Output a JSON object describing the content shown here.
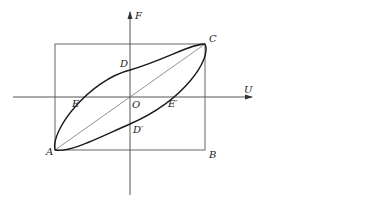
{
  "figure": {
    "axes": {
      "x_label": "U",
      "y_label": "F",
      "origin_label": "O"
    },
    "points": {
      "A": "A",
      "B": "B",
      "C": "C",
      "D": "D",
      "D_prime": "D′",
      "E": "E",
      "E_prime": "E′"
    },
    "colors": {
      "loop": "#1a1a1a",
      "axis": "#555555",
      "rect": "#666666",
      "diagonal": "#777777",
      "text": "#222222"
    }
  }
}
